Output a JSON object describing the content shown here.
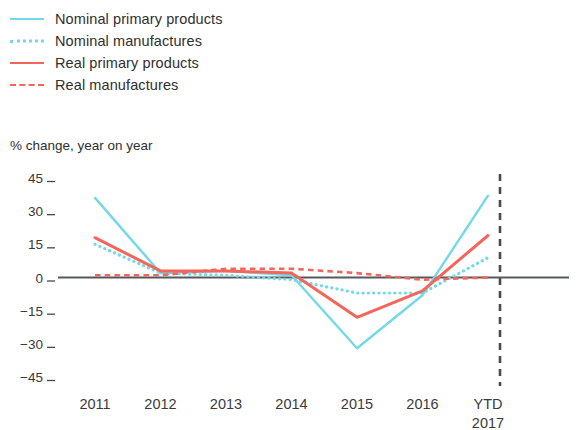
{
  "legend": {
    "items": [
      {
        "label": "Nominal primary products",
        "style": "solid",
        "color": "#72d9e8",
        "icon": "line-swatch-solid-cyan"
      },
      {
        "label": "Nominal manufactures",
        "style": "dotted",
        "color": "#72d9e8",
        "icon": "line-swatch-dotted-cyan"
      },
      {
        "label": "Real primary products",
        "style": "solid",
        "color": "#f4655c",
        "icon": "line-swatch-solid-red"
      },
      {
        "label": "Real manufactures",
        "style": "dashed",
        "color": "#f4655c",
        "icon": "line-swatch-dashed-red"
      }
    ]
  },
  "axis_title": "% change, year on year",
  "chart_data": {
    "type": "line",
    "title": "",
    "subtitle": "% change, year on year",
    "xlabel": "",
    "ylabel": "% change, year on year",
    "categories": [
      "2011",
      "2012",
      "2013",
      "2014",
      "2015",
      "2016",
      "YTD 2017"
    ],
    "x_tick_labels": [
      "2011",
      "2012",
      "2013",
      "2014",
      "2015",
      "2016",
      "YTD\n2017"
    ],
    "y_tick_labels": [
      "45",
      "30",
      "15",
      "0",
      "−15",
      "−30",
      "−45"
    ],
    "y_ticks": [
      45,
      30,
      15,
      0,
      -15,
      -30,
      -45
    ],
    "ylim": [
      -45,
      45
    ],
    "grid": false,
    "legend_position": "above-plot",
    "zero_line": true,
    "annotations": [
      {
        "type": "vertical-dashed-line",
        "between": [
          "2016",
          "YTD 2017"
        ],
        "color": "#4a4a4a"
      }
    ],
    "series": [
      {
        "name": "Nominal primary products",
        "color": "#72d9e8",
        "style": "solid",
        "values": [
          36,
          2,
          3,
          1,
          -32,
          -8,
          37
        ]
      },
      {
        "name": "Nominal manufactures",
        "color": "#72d9e8",
        "style": "dotted",
        "values": [
          15,
          2,
          1,
          -1,
          -7,
          -7,
          9
        ]
      },
      {
        "name": "Real primary products",
        "color": "#f4655c",
        "style": "solid",
        "values": [
          18,
          3,
          3,
          2,
          -18,
          -6,
          19
        ]
      },
      {
        "name": "Real manufactures",
        "color": "#f4655c",
        "style": "dashed",
        "values": [
          1,
          1,
          4,
          4,
          2,
          -1,
          0
        ]
      }
    ]
  }
}
